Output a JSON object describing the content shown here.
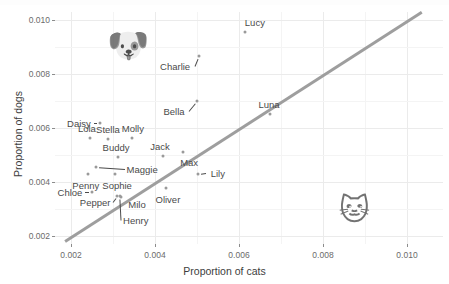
{
  "axes": {
    "x_title": "Proportion of cats",
    "y_title": "Proportion of dogs",
    "x_ticks": [
      "0.002",
      "0.004",
      "0.006",
      "0.008",
      "0.010"
    ],
    "y_ticks": [
      "0.002",
      "0.004",
      "0.006",
      "0.008",
      "0.010"
    ]
  },
  "decorations": {
    "dog_emoji": "🐶",
    "cat_emoji": "🐱"
  },
  "chart_data": {
    "type": "scatter",
    "title": "",
    "xlabel": "Proportion of cats",
    "ylabel": "Proportion of dogs",
    "xlim": [
      0.0016,
      0.0106
    ],
    "ylim": [
      0.0018,
      0.0106
    ],
    "xticks": [
      0.002,
      0.004,
      0.006,
      0.008,
      0.01
    ],
    "yticks": [
      0.002,
      0.004,
      0.006,
      0.008,
      0.01
    ],
    "grid": true,
    "legend": "none",
    "point_color": "#9a9a9a",
    "line_color": "#9e9e9e",
    "reference_line": {
      "type": "identity",
      "label": "y = x",
      "x0": 0.00185,
      "y0": 0.00185,
      "x1": 0.01035,
      "y1": 0.01035
    },
    "points": [
      {
        "name": "Lucy",
        "x": 0.00614,
        "y": 0.00957,
        "label_dx": 10,
        "label_dy": -10
      },
      {
        "name": "Charlie",
        "x": 0.00505,
        "y": 0.00867,
        "label_dx": -24,
        "label_dy": 10
      },
      {
        "name": "Bella",
        "x": 0.005,
        "y": 0.007,
        "label_dx": -23,
        "label_dy": 10
      },
      {
        "name": "Luna",
        "x": 0.00674,
        "y": 0.00652,
        "label_dx": -1,
        "label_dy": -10
      },
      {
        "name": "Daisy",
        "x": 0.00269,
        "y": 0.00619,
        "label_dx": -21,
        "label_dy": 0
      },
      {
        "name": "Lola",
        "x": 0.00245,
        "y": 0.00563,
        "label_dx": -3,
        "label_dy": -10
      },
      {
        "name": "Stella",
        "x": 0.00288,
        "y": 0.00561,
        "label_dx": 0,
        "label_dy": -10
      },
      {
        "name": "Molly",
        "x": 0.00345,
        "y": 0.00563,
        "label_dx": 1,
        "label_dy": -10
      },
      {
        "name": "Buddy",
        "x": 0.00312,
        "y": 0.00493,
        "label_dx": -2,
        "label_dy": -10
      },
      {
        "name": "Jack",
        "x": 0.00419,
        "y": 0.00496,
        "label_dx": -3,
        "label_dy": -10
      },
      {
        "name": "Max",
        "x": 0.00467,
        "y": 0.00511,
        "label_dx": 6,
        "label_dy": 10
      },
      {
        "name": "Maggie",
        "x": 0.0026,
        "y": 0.00455,
        "label_dx": 46,
        "label_dy": 2
      },
      {
        "name": "Penny",
        "x": 0.0024,
        "y": 0.0043,
        "label_dx": -2,
        "label_dy": 11
      },
      {
        "name": "Sophie",
        "x": 0.00305,
        "y": 0.0043,
        "label_dx": 2,
        "label_dy": 11
      },
      {
        "name": "Lily",
        "x": 0.00502,
        "y": 0.0043,
        "label_dx": 20,
        "label_dy": -1
      },
      {
        "name": "Chloe",
        "x": 0.0025,
        "y": 0.00364,
        "label_dx": -22,
        "label_dy": 0
      },
      {
        "name": "Oliver",
        "x": 0.00426,
        "y": 0.00376,
        "label_dx": 2,
        "label_dy": 11
      },
      {
        "name": "Pepper",
        "x": 0.0031,
        "y": 0.0035,
        "label_dx": -22,
        "label_dy": 6
      },
      {
        "name": "Milo",
        "x": 0.00319,
        "y": 0.00345,
        "label_dx": 16,
        "label_dy": 7
      },
      {
        "name": "Henry",
        "x": 0.00316,
        "y": 0.00348,
        "label_dx": 16,
        "label_dy": 24
      }
    ]
  }
}
